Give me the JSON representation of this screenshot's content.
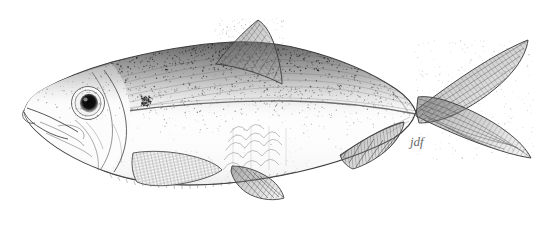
{
  "image": {
    "kind": "scientific-illustration",
    "medium": "pen-and-ink stipple drawing",
    "subject": "fish, lateral view, facing left",
    "background_color": "#ffffff",
    "ink_color": "#4a4a4a",
    "dark_ink_color": "#1c1c1c",
    "width": 539,
    "height": 234,
    "alt_text": "Black and white stipple ink drawing of a herring-like fish in left lateral view with a deeply forked tail."
  },
  "signature": {
    "text": "jdf",
    "x": 410,
    "y": 137,
    "color": "#6a6a6a"
  },
  "anatomy": {
    "body_label": "fish-body",
    "parts": [
      {
        "name": "head",
        "label": "Head"
      },
      {
        "name": "snout-mouth",
        "label": "Snout and upturned mouth"
      },
      {
        "name": "eye",
        "label": "Eye"
      },
      {
        "name": "pupil",
        "label": "Pupil"
      },
      {
        "name": "operculum",
        "label": "Operculum (gill cover)"
      },
      {
        "name": "preopercle",
        "label": "Preopercle"
      },
      {
        "name": "humeral-spot",
        "label": "Humeral spot"
      },
      {
        "name": "dorsal-shading",
        "label": "Dark stippled dorsum"
      },
      {
        "name": "lateral-stripe",
        "label": "Lateral stripe"
      },
      {
        "name": "ventral-keel",
        "label": "Serrated ventral keel"
      },
      {
        "name": "scale-patch",
        "label": "Scale patch"
      },
      {
        "name": "dorsal-fin",
        "label": "Dorsal fin"
      },
      {
        "name": "pectoral-fin",
        "label": "Pectoral fin"
      },
      {
        "name": "pelvic-fin",
        "label": "Pelvic fin"
      },
      {
        "name": "anal-fin",
        "label": "Anal fin"
      },
      {
        "name": "caudal-fin",
        "label": "Caudal fin (deeply forked)"
      },
      {
        "name": "caudal-peduncle",
        "label": "Caudal peduncle"
      }
    ]
  },
  "render": {
    "stipple_seed": 20246,
    "stipple_counts": {
      "dorsum_dense": 2600,
      "dorsum_mid": 1400,
      "flank_sparse": 420,
      "head_light": 330,
      "belly_faint": 120
    }
  }
}
